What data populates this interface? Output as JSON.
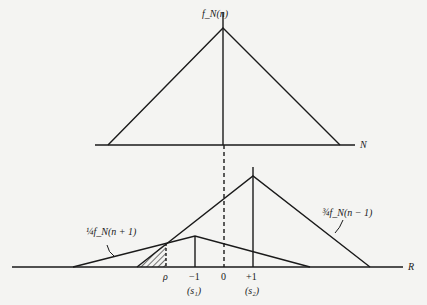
{
  "figure": {
    "top_panel": {
      "function_label": "f_N(n)",
      "axis_label": "N"
    },
    "bottom_panel": {
      "axis_label": "R",
      "curve_left_label": "¼f_N(n + 1)",
      "curve_left_label_parts": {
        "coef": "¼",
        "body": "f",
        "sub": "N",
        "arg": "(n + 1)"
      },
      "curve_right_label": "¾f_N(n − 1)",
      "curve_right_label_parts": {
        "coef": "¾",
        "body": "f",
        "sub": "N",
        "arg": "(n − 1)"
      },
      "ticks": [
        {
          "label": "ρ",
          "sub": ""
        },
        {
          "label": "−1",
          "sub": "(s₁)"
        },
        {
          "label": "0",
          "sub": ""
        },
        {
          "label": "+1",
          "sub": "(s₂)"
        }
      ]
    },
    "colors": {
      "ink": "#1a1a1a",
      "paper": "#f4f4f2"
    }
  }
}
